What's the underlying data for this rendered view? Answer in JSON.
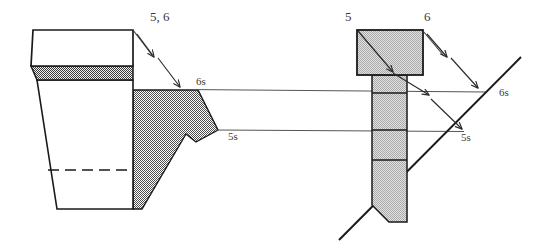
{
  "figure": {
    "type": "engineering-projection-diagram",
    "background_color": "#ffffff",
    "line_color": "#1a1a1a",
    "shade_fill_color": "#808080",
    "light_fill_color": "#c8c8c8",
    "dark_band_color": "#6e6e6e",
    "labels": {
      "left_source": "5, 6",
      "left_upper_shadow": "6s",
      "left_lower_shadow": "5s",
      "right_point_5": "5",
      "right_point_6": "6",
      "right_upper_shadow": "6s",
      "right_lower_shadow": "5s"
    }
  },
  "left_view": {
    "name": "tapered-bucket-view",
    "top_box": {
      "top_left_x": 33,
      "top_right_x": 133,
      "top_y": 30,
      "bottom_left_x": 31,
      "bottom_right_x": 133,
      "bottom_y": 66
    },
    "dark_band": {
      "top_y": 66,
      "bottom_y": 80,
      "left_top_x": 31,
      "left_bottom_x": 37,
      "right_x": 133
    },
    "lower_body": {
      "left_top_x": 37,
      "left_bottom_x": 57,
      "right_top_x": 133,
      "right_bottom_x": 133,
      "top_y": 80,
      "bottom_y": 209
    },
    "dashed_line": {
      "x1": 48,
      "x2": 133,
      "y": 170
    },
    "shaded_polygon_points": "133,90 198,90 218,130 196,142 186,134 142,209 133,209",
    "arrows": [
      {
        "name": "arrow-5-6-first",
        "x1": 133,
        "y1": 30,
        "x2": 154,
        "y2": 58
      },
      {
        "name": "arrow-5-6-second",
        "x1": 157,
        "y1": 58,
        "x2": 180,
        "y2": 88
      }
    ]
  },
  "right_view": {
    "name": "tee-profile-view",
    "head_box": {
      "x": 357,
      "y": 30,
      "width": 66,
      "height": 45
    },
    "shaft": {
      "x": 372,
      "y": 75,
      "width": 35,
      "bottom_y": 222
    },
    "shaft_dividers_y": [
      93,
      130,
      160
    ],
    "incline_line": {
      "x1": 339,
      "y1": 240,
      "x2": 520,
      "y2": 58
    },
    "inner_diagonal_arrow": {
      "x1": 358,
      "y1": 31,
      "x2": 394,
      "y2": 73
    },
    "arrows": [
      {
        "name": "arrow-6-first",
        "x1": 424,
        "y1": 31,
        "x2": 447,
        "y2": 58
      },
      {
        "name": "arrow-6-second",
        "x1": 450,
        "y1": 58,
        "x2": 477,
        "y2": 88
      },
      {
        "name": "arrow-5-to-6s",
        "x1": 394,
        "y1": 74,
        "x2": 428,
        "y2": 95
      },
      {
        "name": "arrow-6s-to-5s",
        "x1": 432,
        "y1": 99,
        "x2": 462,
        "y2": 130
      }
    ]
  },
  "projection_rays": [
    {
      "name": "ray-6s",
      "x1": 198,
      "y1": 90,
      "x2": 483,
      "y2": 92
    },
    {
      "name": "ray-5s",
      "x1": 218,
      "y1": 130,
      "x2": 462,
      "y2": 131
    }
  ],
  "label_positions": {
    "left_source": {
      "x": 150,
      "y": 12
    },
    "left_upper_shadow": {
      "x": 196,
      "y": 79
    },
    "left_lower_shadow": {
      "x": 227,
      "y": 134
    },
    "right_point_5": {
      "x": 345,
      "y": 12
    },
    "right_point_6": {
      "x": 424,
      "y": 12
    },
    "right_upper_shadow": {
      "x": 498,
      "y": 88
    },
    "right_lower_shadow": {
      "x": 460,
      "y": 135
    }
  }
}
